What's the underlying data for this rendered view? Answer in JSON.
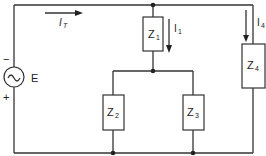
{
  "diagram": {
    "type": "circuit",
    "source": {
      "label": "E",
      "symbol": "ac-source",
      "minus": "−",
      "plus": "+"
    },
    "currents": {
      "total": {
        "main": "I",
        "sub": "T"
      },
      "branch1": {
        "main": "I",
        "sub": "1"
      },
      "branch4": {
        "main": "I",
        "sub": "4"
      }
    },
    "impedances": [
      {
        "main": "Z",
        "sub": "1"
      },
      {
        "main": "Z",
        "sub": "2"
      },
      {
        "main": "Z",
        "sub": "3"
      },
      {
        "main": "Z",
        "sub": "4"
      }
    ]
  }
}
